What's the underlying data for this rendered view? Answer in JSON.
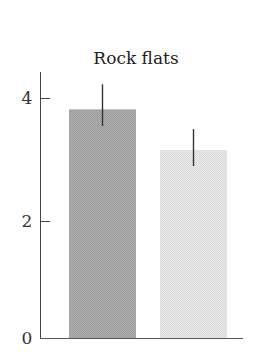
{
  "chart_data": {
    "type": "bar",
    "title": "Rock flats",
    "xlabel": "",
    "ylabel": "",
    "categories": [
      "",
      ""
    ],
    "series": [
      {
        "name": "",
        "values": [
          3.83,
          3.15
        ],
        "error_upper": [
          4.25,
          3.5
        ],
        "error_lower": [
          3.55,
          2.88
        ],
        "colors": [
          "#a9a9a9",
          "#e4e4e4"
        ]
      }
    ],
    "ylim": [
      0,
      4.5
    ],
    "yticks": [
      0,
      2,
      4
    ],
    "ytick_labels": [
      "0",
      "2",
      "4"
    ],
    "grid": false,
    "legend": null
  },
  "colors": {
    "axis": "#444444",
    "bar_dark": "#a9a9a9",
    "bar_light": "#e4e4e4",
    "error_bar": "#333333"
  }
}
